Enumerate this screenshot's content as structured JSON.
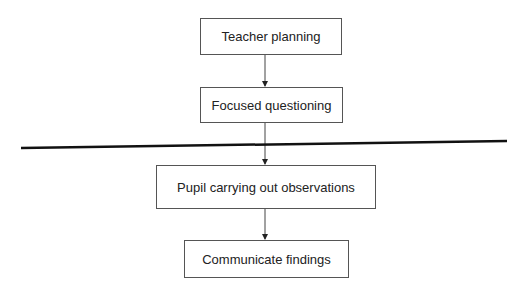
{
  "diagram": {
    "type": "flowchart",
    "nodes": [
      {
        "id": "n1",
        "label": "Teacher planning"
      },
      {
        "id": "n2",
        "label": "Focused questioning"
      },
      {
        "id": "n3",
        "label": "Pupil carrying out observations"
      },
      {
        "id": "n4",
        "label": "Communicate findings"
      }
    ],
    "edges": [
      {
        "from": "n1",
        "to": "n2"
      },
      {
        "from": "n2",
        "to": "n3"
      },
      {
        "from": "n3",
        "to": "n4"
      }
    ],
    "divider": "thick horizontal line between Focused questioning and Pupil carrying out observations"
  }
}
